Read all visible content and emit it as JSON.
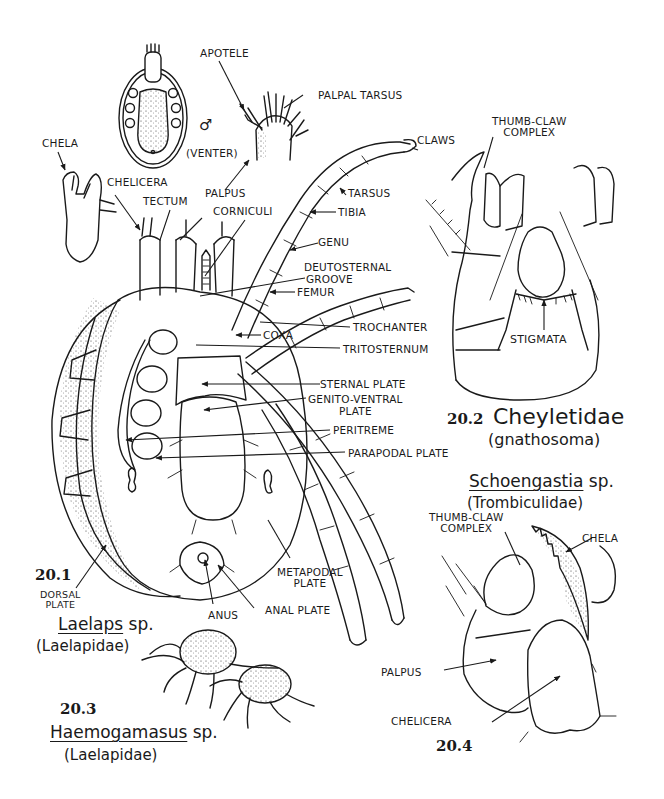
{
  "plate": {
    "background": "#ffffff",
    "ink": "#1a1a1a"
  },
  "figures": {
    "fig_20_1": {
      "number": "20.1",
      "genus": "Laelaps",
      "species_suffix": "sp.",
      "family": "(Laelapidae)",
      "inset_label": "VENTER",
      "inset_symbol": "♂",
      "labels": [
        {
          "id": "apotele",
          "text": "APOTELE"
        },
        {
          "id": "palpal-tarsus",
          "text": "PALPAL TARSUS"
        },
        {
          "id": "chela",
          "text": "CHELA"
        },
        {
          "id": "chelicera",
          "text": "CHELICERA"
        },
        {
          "id": "tectum",
          "text": "TECTUM"
        },
        {
          "id": "palpus",
          "text": "PALPUS"
        },
        {
          "id": "corniculi",
          "text": "CORNICULI"
        },
        {
          "id": "claws",
          "text": "CLAWS"
        },
        {
          "id": "tarsus",
          "text": "TARSUS"
        },
        {
          "id": "tibia",
          "text": "TIBIA"
        },
        {
          "id": "genu",
          "text": "GENU"
        },
        {
          "id": "deutosternal-groove",
          "text": "DEUTOSTERNAL",
          "text2": "GROOVE"
        },
        {
          "id": "femur",
          "text": "FEMUR"
        },
        {
          "id": "coxa",
          "text": "COXA"
        },
        {
          "id": "trochanter",
          "text": "TROCHANTER"
        },
        {
          "id": "tritosternum",
          "text": "TRITOSTERNUM"
        },
        {
          "id": "sternal-plate",
          "text": "STERNAL PLATE"
        },
        {
          "id": "genito-ventral-plate",
          "text": "GENITO-VENTRAL",
          "text2": "PLATE"
        },
        {
          "id": "peritreme",
          "text": "PERITREME"
        },
        {
          "id": "parapodal-plate",
          "text": "PARAPODAL PLATE"
        },
        {
          "id": "metapodal-plate",
          "text": "METAPODAL",
          "text2": "PLATE"
        },
        {
          "id": "dorsal-plate",
          "text": "DORSAL",
          "text2": "PLATE"
        },
        {
          "id": "anus",
          "text": "ANUS"
        },
        {
          "id": "anal-plate",
          "text": "ANAL PLATE"
        }
      ]
    },
    "fig_20_2": {
      "number": "20.2",
      "title": "Cheyletidae",
      "subtitle": "(gnathosoma)",
      "labels": [
        {
          "id": "thumb-claw-complex",
          "text": "THUMB-CLAW",
          "text2": "COMPLEX"
        },
        {
          "id": "stigmata",
          "text": "STIGMATA"
        }
      ]
    },
    "fig_20_3": {
      "number": "20.3",
      "genus": "Haemogamasus",
      "species_suffix": "sp.",
      "family": "(Laelapidae)"
    },
    "fig_20_4": {
      "number": "20.4",
      "genus": "Schoengastia",
      "species_suffix": "sp.",
      "family": "(Trombiculidae)",
      "labels": [
        {
          "id": "thumb-claw-complex",
          "text": "THUMB-CLAW",
          "text2": "COMPLEX"
        },
        {
          "id": "chela",
          "text": "CHELA"
        },
        {
          "id": "palpus",
          "text": "PALPUS"
        },
        {
          "id": "chelicera",
          "text": "CHELICERA"
        }
      ]
    }
  }
}
